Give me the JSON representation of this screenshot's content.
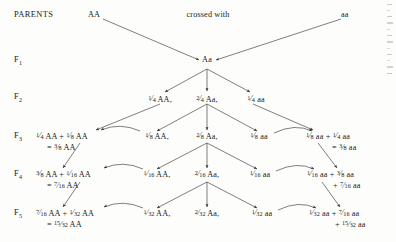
{
  "figure": {
    "row_labels": {
      "parents": "PARENTS",
      "f1": "F",
      "f1_sub": "1",
      "f2": "F",
      "f2_sub": "2",
      "f3": "F",
      "f3_sub": "3",
      "f4": "F",
      "f4_sub": "4",
      "f5": "F",
      "f5_sub": "5"
    },
    "parents": {
      "left_genotype": "AA",
      "cross_label": "crossed with",
      "right_genotype": "aa"
    },
    "f1": {
      "genotype": "Aa"
    },
    "f2": {
      "left": {
        "num": "1",
        "den": "4",
        "genotype": "AA,"
      },
      "center": {
        "num": "2",
        "den": "4",
        "genotype": "Aa,"
      },
      "right": {
        "num": "1",
        "den": "4",
        "genotype": "aa"
      }
    },
    "f3": {
      "left_sum": {
        "term1_num": "1",
        "term1_den": "4",
        "term1_gen": "AA",
        "plus": "+",
        "term2_num": "1",
        "term2_den": "8",
        "term2_gen": "AA",
        "equals": "=",
        "total_num": "3",
        "total_den": "8",
        "total_gen": "AA"
      },
      "center_left": {
        "num": "1",
        "den": "8",
        "genotype": "AA,"
      },
      "center": {
        "num": "2",
        "den": "8",
        "genotype": "Aa,"
      },
      "center_right": {
        "num": "1",
        "den": "8",
        "genotype": "aa"
      },
      "right_sum": {
        "term1_num": "1",
        "term1_den": "8",
        "term1_gen": "aa",
        "plus": "+",
        "term2_num": "1",
        "term2_den": "4",
        "term2_gen": "aa",
        "equals": "=",
        "total_num": "3",
        "total_den": "8",
        "total_gen": "aa"
      }
    },
    "f4": {
      "left_sum": {
        "term1_num": "3",
        "term1_den": "8",
        "term1_gen": "AA",
        "plus": "+",
        "term2_num": "1",
        "term2_den": "16",
        "term2_gen": "AA",
        "equals": "=",
        "total_num": "7",
        "total_den": "16",
        "total_gen": "AA"
      },
      "center_left": {
        "num": "1",
        "den": "16",
        "genotype": "AA,"
      },
      "center": {
        "num": "2",
        "den": "16",
        "genotype": "Aa,"
      },
      "center_right": {
        "num": "1",
        "den": "16",
        "genotype": "aa"
      },
      "right_sum": {
        "term1_num": "1",
        "term1_den": "16",
        "term1_gen": "aa",
        "plus": "+",
        "term2_num": "3",
        "term2_den": "8",
        "term2_gen": "aa",
        "plus2": "+",
        "total_num": "7",
        "total_den": "16",
        "total_gen": "aa"
      }
    },
    "f5": {
      "left_sum": {
        "term1_num": "7",
        "term1_den": "16",
        "term1_gen": "AA",
        "plus": "+",
        "term2_num": "1",
        "term2_den": "32",
        "term2_gen": "AA",
        "equals": "=",
        "total_num": "15",
        "total_den": "32",
        "total_gen": "AA"
      },
      "center_left": {
        "num": "1",
        "den": "32",
        "genotype": "AA,"
      },
      "center": {
        "num": "2",
        "den": "32",
        "genotype": "Aa,"
      },
      "center_right": {
        "num": "1",
        "den": "32",
        "genotype": "aa"
      },
      "right_sum": {
        "term1_num": "1",
        "term1_den": "32",
        "term1_gen": "aa",
        "plus": "+",
        "term2_num": "7",
        "term2_den": "16",
        "term2_gen": "aa",
        "plus2": "+",
        "total_num": "15",
        "total_den": "32",
        "total_gen": "aa"
      }
    },
    "colors": {
      "ink": "#1a1a1a",
      "line": "#3a3a3a",
      "background": "#fdfdfb"
    }
  }
}
